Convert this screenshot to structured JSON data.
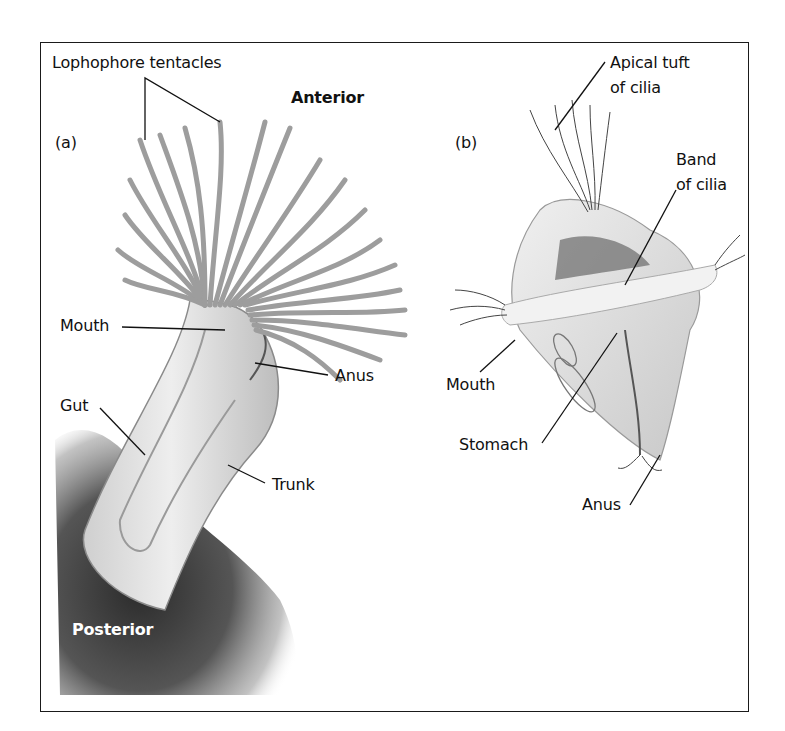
{
  "figure": {
    "panels": [
      {
        "id": "a",
        "tag": "(a)",
        "labels": {
          "lophophore": "Lophophore tentacles",
          "anterior": "Anterior",
          "mouth": "Mouth",
          "anus": "Anus",
          "gut": "Gut",
          "trunk": "Trunk",
          "posterior": "Posterior"
        }
      },
      {
        "id": "b",
        "tag": "(b)",
        "labels": {
          "apical_line1": "Apical tuft",
          "apical_line2": "of cilia",
          "band_line1": "Band",
          "band_line2": "of cilia",
          "mouth": "Mouth",
          "stomach": "Stomach",
          "anus": "Anus"
        }
      }
    ]
  }
}
